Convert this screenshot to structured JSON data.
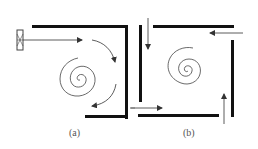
{
  "figure": {
    "colors": {
      "wall": "#111111",
      "arrow": "#333333",
      "spiral": "#444444",
      "label": "#555555"
    }
  },
  "panels": [
    {
      "id": "a",
      "label": "(a)",
      "elements": [
        "fan",
        "inlet-arrow",
        "top-wall",
        "right-wall",
        "bottom-wall",
        "spiral",
        "curved-arrow-upper",
        "curved-arrow-lower"
      ]
    },
    {
      "id": "b",
      "label": "(b)",
      "elements": [
        "left-wall",
        "top-wall",
        "right-wall",
        "bottom-wall",
        "spiral",
        "arrow-down",
        "arrow-left",
        "arrow-right",
        "arrow-up"
      ]
    }
  ]
}
